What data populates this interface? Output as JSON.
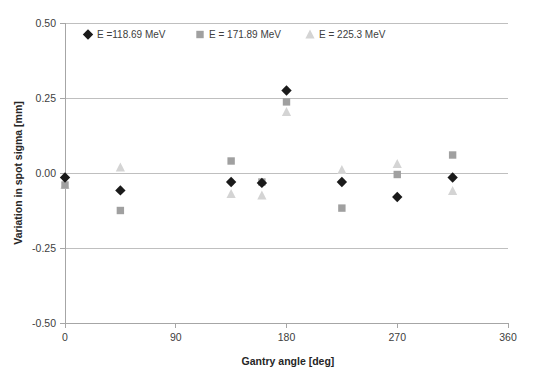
{
  "chart_data": {
    "type": "scatter",
    "title": "",
    "xlabel": "Gantry angle [deg]",
    "ylabel": "Variation in spot sigma [mm]",
    "xlim": [
      0,
      360
    ],
    "ylim": [
      -0.5,
      0.5
    ],
    "xticks": [
      "0",
      "90",
      "180",
      "270",
      "360"
    ],
    "xtick_values": [
      0,
      90,
      180,
      270,
      360
    ],
    "yticks": [
      "0.50",
      "0.25",
      "0.00",
      "-0.25",
      "-0.50"
    ],
    "ytick_values": [
      0.5,
      0.25,
      0.0,
      -0.25,
      -0.5
    ],
    "grid": "horizontal",
    "legend_position": "top-left-inside",
    "series": [
      {
        "name": "E =118.69 MeV",
        "marker": "diamond",
        "color": "#1a1a1a",
        "x": [
          0,
          45,
          135,
          160,
          180,
          225,
          270,
          315
        ],
        "values": [
          -0.015,
          -0.058,
          -0.03,
          -0.033,
          0.275,
          -0.03,
          -0.08,
          -0.015
        ]
      },
      {
        "name": "E = 171.89 MeV",
        "marker": "square",
        "color": "#a0a0a0",
        "x": [
          0,
          45,
          135,
          160,
          180,
          225,
          270,
          315
        ],
        "values": [
          -0.04,
          -0.125,
          0.04,
          -0.03,
          0.237,
          -0.117,
          -0.005,
          0.06
        ]
      },
      {
        "name": "E = 225.3 MeV",
        "marker": "triangle",
        "color": "#d4d4d4",
        "x": [
          0,
          45,
          135,
          160,
          180,
          225,
          270,
          315
        ],
        "values": [
          -0.04,
          0.018,
          -0.07,
          -0.075,
          0.203,
          0.01,
          0.03,
          -0.06
        ]
      }
    ]
  },
  "style": {
    "axis_color": "#a6a6a6",
    "grid_color": "#bfbfbf",
    "text_color": "#404040",
    "background": "#ffffff"
  }
}
